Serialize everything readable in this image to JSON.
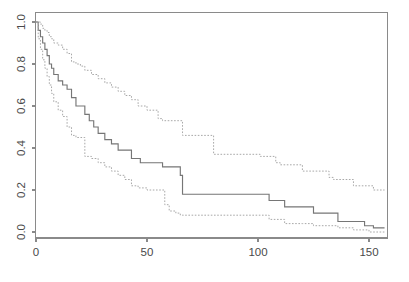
{
  "chart_data": {
    "type": "line",
    "subtype": "kaplan-meier-step",
    "title": "",
    "subtitle": "",
    "xlabel": "",
    "ylabel": "",
    "xlim": [
      0,
      160
    ],
    "ylim": [
      0,
      1.0
    ],
    "xticks": [
      0,
      50,
      100,
      150
    ],
    "xticklabels": [
      "0",
      "50",
      "100",
      "150"
    ],
    "yticks": [
      0.0,
      0.2,
      0.4,
      0.6,
      0.8,
      1.0
    ],
    "yticklabels": [
      "0.0",
      "0.2",
      "0.4",
      "0.6",
      "0.8",
      "1.0"
    ],
    "grid": false,
    "legend": false,
    "legend_position": "none",
    "box_frame": true,
    "colors": {
      "estimate": "#767676",
      "band": "#a8a8a8",
      "axis": "#8a8a8a",
      "text": "#4a4a4a",
      "background": "#ffffff"
    },
    "series": [
      {
        "name": "Upper confidence limit",
        "style": "dotted",
        "step": "post",
        "x": [
          0,
          1,
          2,
          3,
          4,
          5,
          6,
          7,
          8,
          10,
          12,
          14,
          16,
          18,
          20,
          22,
          25,
          28,
          31,
          34,
          37,
          40,
          43,
          46,
          50,
          55,
          57,
          65,
          66,
          80,
          100,
          101,
          108,
          110,
          120,
          122,
          132,
          134,
          143,
          152,
          157
        ],
        "y": [
          1.0,
          1.0,
          0.99,
          0.97,
          0.96,
          0.95,
          0.93,
          0.92,
          0.9,
          0.89,
          0.87,
          0.85,
          0.81,
          0.8,
          0.79,
          0.77,
          0.75,
          0.73,
          0.71,
          0.69,
          0.67,
          0.65,
          0.63,
          0.6,
          0.58,
          0.54,
          0.53,
          0.53,
          0.46,
          0.37,
          0.37,
          0.36,
          0.33,
          0.32,
          0.29,
          0.29,
          0.26,
          0.25,
          0.22,
          0.2,
          0.2
        ]
      },
      {
        "name": "Survival estimate",
        "style": "solid",
        "step": "post",
        "x": [
          0,
          1,
          2,
          3,
          4,
          5,
          6,
          7,
          8,
          10,
          12,
          14,
          16,
          18,
          20,
          22,
          24,
          26,
          28,
          31,
          34,
          37,
          40,
          43,
          47,
          50,
          55,
          57,
          65,
          66,
          80,
          95,
          100,
          105,
          108,
          112,
          120,
          125,
          132,
          136,
          143,
          148,
          152,
          157
        ],
        "y": [
          1.0,
          0.96,
          0.93,
          0.9,
          0.87,
          0.84,
          0.8,
          0.78,
          0.75,
          0.72,
          0.7,
          0.68,
          0.64,
          0.6,
          0.6,
          0.56,
          0.53,
          0.5,
          0.47,
          0.44,
          0.42,
          0.39,
          0.39,
          0.35,
          0.33,
          0.33,
          0.33,
          0.31,
          0.27,
          0.18,
          0.18,
          0.18,
          0.18,
          0.15,
          0.15,
          0.12,
          0.12,
          0.09,
          0.09,
          0.05,
          0.05,
          0.03,
          0.02,
          0.02
        ]
      },
      {
        "name": "Lower confidence limit",
        "style": "dotted",
        "step": "post",
        "x": [
          0,
          1,
          2,
          3,
          4,
          5,
          6,
          7,
          8,
          10,
          12,
          14,
          16,
          18,
          20,
          22,
          25,
          28,
          31,
          34,
          37,
          40,
          43,
          46,
          50,
          55,
          58,
          60,
          63,
          65,
          66,
          80,
          100,
          105,
          108,
          112,
          120,
          125,
          132,
          136,
          143,
          150,
          157
        ],
        "y": [
          1.0,
          0.92,
          0.87,
          0.82,
          0.78,
          0.74,
          0.7,
          0.66,
          0.62,
          0.58,
          0.55,
          0.5,
          0.46,
          0.45,
          0.45,
          0.36,
          0.35,
          0.33,
          0.31,
          0.29,
          0.27,
          0.25,
          0.22,
          0.21,
          0.2,
          0.2,
          0.13,
          0.1,
          0.09,
          0.08,
          0.08,
          0.08,
          0.08,
          0.06,
          0.06,
          0.04,
          0.04,
          0.03,
          0.03,
          0.02,
          0.01,
          0.0,
          0.0
        ]
      }
    ]
  },
  "figure": {
    "axis_label_x": "",
    "axis_label_y": ""
  }
}
